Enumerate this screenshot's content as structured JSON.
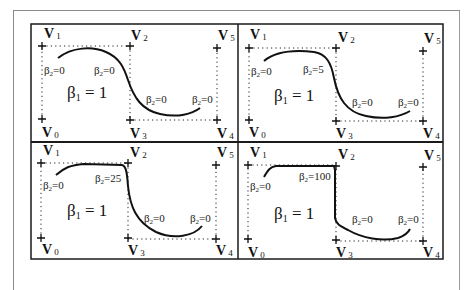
{
  "figure": {
    "panels": [
      {
        "id": "p1",
        "beta1_label": "β1 = 1",
        "beta1_main": "β",
        "beta1_sub": "1",
        "beta1_rest": " = 1",
        "beta2_labels": [
          "β2=0",
          "β2=0",
          "β2=0",
          "β2=0"
        ],
        "beta2_values": [
          "0",
          "0",
          "0",
          "0"
        ],
        "tension": 0
      },
      {
        "id": "p2",
        "beta1_label": "β1 = 1",
        "beta1_main": "β",
        "beta1_sub": "1",
        "beta1_rest": " = 1",
        "beta2_labels": [
          "β2=0",
          "β2=5",
          "β2=0",
          "β2=0"
        ],
        "beta2_values": [
          "0",
          "5",
          "0",
          "0"
        ],
        "tension": 5
      },
      {
        "id": "p3",
        "beta1_label": "β1 = 1",
        "beta1_main": "β",
        "beta1_sub": "1",
        "beta1_rest": " = 1",
        "beta2_labels": [
          "β2=0",
          "β2=25",
          "β2=0",
          "β2=0"
        ],
        "beta2_values": [
          "0",
          "25",
          "0",
          "0"
        ],
        "tension": 25
      },
      {
        "id": "p4",
        "beta1_label": "β1 = 1",
        "beta1_main": "β",
        "beta1_sub": "1",
        "beta1_rest": " = 1",
        "beta2_labels": [
          "β2=0",
          "β2=100",
          "β2=0",
          "β2=0"
        ],
        "beta2_values": [
          "0",
          "100",
          "0",
          "0"
        ],
        "tension": 100
      }
    ],
    "vertex_labels": {
      "v0": {
        "main": "V",
        "sub": "0"
      },
      "v1": {
        "main": "V",
        "sub": "1"
      },
      "v2": {
        "main": "V",
        "sub": "2"
      },
      "v3": {
        "main": "V",
        "sub": "3"
      },
      "v4": {
        "main": "V",
        "sub": "4"
      },
      "v5": {
        "main": "V",
        "sub": "5"
      }
    },
    "beta2_symbol": "β",
    "beta2_sub": "2",
    "colors": {
      "frame": "#1a1a1a",
      "curve": "#111111",
      "dotted": "#222222",
      "outer_frame": "#8a8a8a"
    }
  }
}
